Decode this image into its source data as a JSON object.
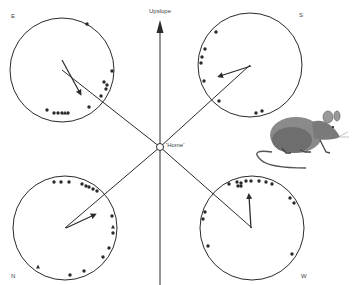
{
  "labels": {
    "upslope": "Upslope",
    "home": "'Home'",
    "E": "E",
    "S": "S",
    "N": "N",
    "W": "W"
  },
  "colors": {
    "ink": "#2a2a2a",
    "background": "#ffffff"
  },
  "home": {
    "x": 160,
    "y": 147,
    "r": 3.5
  },
  "upslope_axis": {
    "x": 160,
    "y_top": 20,
    "y_bottom": 285
  },
  "panels": [
    {
      "id": "E",
      "label": "E",
      "label_pos": [
        11,
        19
      ],
      "center": [
        62,
        70
      ],
      "radius": 52,
      "line_to_home": true,
      "mean_vector": {
        "from": [
          62,
          60
        ],
        "to": [
          80,
          93
        ]
      },
      "dots": [
        [
          87,
          24
        ],
        [
          112,
          71
        ],
        [
          104,
          82
        ],
        [
          107,
          85
        ],
        [
          106,
          89
        ],
        [
          101,
          96
        ],
        [
          89,
          107
        ],
        [
          47,
          110
        ],
        [
          54,
          113
        ],
        [
          58,
          113
        ],
        [
          62,
          113
        ],
        [
          68,
          113
        ]
      ],
      "triangles": [
        [
          65,
          113
        ]
      ]
    },
    {
      "id": "S",
      "label": "S",
      "label_pos": [
        299,
        18
      ],
      "center": [
        250,
        65
      ],
      "radius": 52,
      "line_to_home": true,
      "mean_vector": {
        "from": [
          251,
          66
        ],
        "to": [
          220,
          76
        ]
      },
      "dots": [
        [
          216,
          32
        ],
        [
          205,
          49
        ],
        [
          202,
          57
        ],
        [
          201,
          63
        ],
        [
          204,
          81
        ],
        [
          219,
          101
        ],
        [
          256,
          113
        ],
        [
          262,
          111
        ]
      ],
      "triangles": []
    },
    {
      "id": "N",
      "label": "N",
      "label_pos": [
        11,
        279
      ],
      "center": [
        65,
        228
      ],
      "radius": 52,
      "line_to_home": true,
      "mean_vector": {
        "from": [
          66,
          228
        ],
        "to": [
          94,
          215
        ]
      },
      "dots": [
        [
          54,
          182
        ],
        [
          61,
          182
        ],
        [
          69,
          182
        ],
        [
          82,
          184
        ],
        [
          86,
          186
        ],
        [
          89,
          187
        ],
        [
          93,
          189
        ],
        [
          97,
          191
        ],
        [
          112,
          216
        ],
        [
          113,
          233
        ],
        [
          109,
          248
        ],
        [
          103,
          257
        ],
        [
          84,
          271
        ],
        [
          70,
          275
        ]
      ],
      "triangles": [
        [
          113,
          227
        ],
        [
          38,
          267
        ]
      ]
    },
    {
      "id": "W",
      "label": "W",
      "label_pos": [
        301,
        279
      ],
      "center": [
        252,
        228
      ],
      "radius": 52,
      "line_to_home": true,
      "mean_vector": {
        "from": [
          251,
          228
        ],
        "to": [
          249,
          196
        ]
      },
      "dots": [
        [
          229,
          184
        ],
        [
          237,
          182
        ],
        [
          241,
          183
        ],
        [
          246,
          181
        ],
        [
          251,
          181
        ],
        [
          259,
          181
        ],
        [
          266,
          182
        ],
        [
          272,
          184
        ],
        [
          290,
          198
        ],
        [
          294,
          203
        ],
        [
          205,
          212
        ],
        [
          203,
          219
        ],
        [
          208,
          246
        ],
        [
          292,
          254
        ],
        [
          238,
          186
        ],
        [
          241,
          186
        ]
      ],
      "triangles": []
    }
  ],
  "illustration": {
    "name": "mouse",
    "description": "Sketch of a mouse with long curved tail"
  }
}
